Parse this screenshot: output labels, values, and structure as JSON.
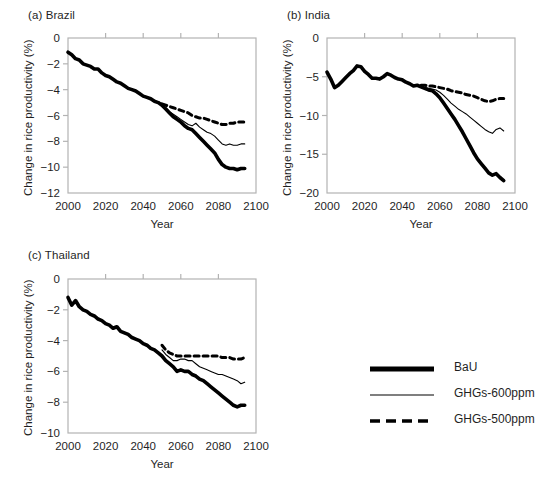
{
  "figure": {
    "axis_color": "#b3b3b3",
    "line_color": "#000000",
    "text_color": "#1f1f1f"
  },
  "panels": [
    {
      "key": "brazil",
      "title": "(a) Brazil",
      "ylabel": "Change in rice productivity (%)",
      "xlabel": "Year"
    },
    {
      "key": "india",
      "title": "(b) India",
      "ylabel": "Change in rice productivity (%)",
      "xlabel": "Year"
    },
    {
      "key": "thailand",
      "title": "(c) Thailand",
      "ylabel": "Change in rice productivity (%)",
      "xlabel": "Year"
    }
  ],
  "legend": {
    "items": [
      {
        "label": "BaU",
        "style": "thick-solid"
      },
      {
        "label": "GHGs-600ppm",
        "style": "thin-solid"
      },
      {
        "label": "GHGs-500ppm",
        "style": "dashed"
      }
    ]
  },
  "chart_data": [
    {
      "type": "line",
      "key": "brazil",
      "title": "(a) Brazil",
      "xlabel": "Year",
      "ylabel": "Change in rice productivity (%)",
      "xlim": [
        2000,
        2100
      ],
      "ylim": [
        -12,
        0
      ],
      "xticks": [
        2000,
        2020,
        2040,
        2060,
        2080,
        2100
      ],
      "yticks": [
        0,
        -2,
        -4,
        -6,
        -8,
        -10,
        -12
      ],
      "xticklabels": [
        "2000",
        "2020",
        "2040",
        "2060",
        "2080",
        "2100"
      ],
      "yticklabels": [
        "0",
        "−2",
        "−4",
        "−6",
        "−8",
        "−10",
        "−12"
      ],
      "grid": false,
      "legend_position": "external-right",
      "series": [
        {
          "name": "BaU",
          "style": "thick-solid",
          "x": [
            2000,
            2002,
            2004,
            2006,
            2008,
            2010,
            2012,
            2014,
            2016,
            2018,
            2020,
            2022,
            2024,
            2026,
            2028,
            2030,
            2032,
            2034,
            2036,
            2038,
            2040,
            2042,
            2044,
            2046,
            2048,
            2050,
            2052,
            2054,
            2056,
            2058,
            2060,
            2062,
            2064,
            2066,
            2068,
            2070,
            2072,
            2074,
            2076,
            2078,
            2080,
            2082,
            2084,
            2086,
            2088,
            2090,
            2092,
            2094
          ],
          "values": [
            -1.1,
            -1.3,
            -1.6,
            -1.7,
            -2.0,
            -2.1,
            -2.2,
            -2.4,
            -2.4,
            -2.7,
            -2.9,
            -3.0,
            -3.2,
            -3.4,
            -3.5,
            -3.7,
            -3.9,
            -4.0,
            -4.1,
            -4.3,
            -4.5,
            -4.6,
            -4.7,
            -4.9,
            -5.0,
            -5.2,
            -5.5,
            -5.8,
            -6.1,
            -6.3,
            -6.5,
            -6.8,
            -7.0,
            -7.1,
            -7.4,
            -7.7,
            -8.0,
            -8.3,
            -8.6,
            -8.9,
            -9.4,
            -9.8,
            -10.0,
            -10.1,
            -10.1,
            -10.2,
            -10.1,
            -10.1
          ]
        },
        {
          "name": "GHGs-600ppm",
          "style": "thin-solid",
          "x": [
            2050,
            2052,
            2054,
            2056,
            2058,
            2060,
            2062,
            2064,
            2066,
            2068,
            2070,
            2072,
            2074,
            2076,
            2078,
            2080,
            2082,
            2084,
            2086,
            2088,
            2090,
            2092,
            2094
          ],
          "values": [
            -5.2,
            -5.4,
            -5.7,
            -5.9,
            -6.1,
            -6.3,
            -6.5,
            -6.7,
            -6.8,
            -6.6,
            -6.9,
            -7.1,
            -7.3,
            -7.4,
            -7.6,
            -7.9,
            -8.2,
            -8.3,
            -8.2,
            -8.3,
            -8.3,
            -8.2,
            -8.2
          ]
        },
        {
          "name": "GHGs-500ppm",
          "style": "dashed",
          "x": [
            2050,
            2052,
            2054,
            2056,
            2058,
            2060,
            2062,
            2064,
            2066,
            2068,
            2070,
            2072,
            2074,
            2076,
            2078,
            2080,
            2082,
            2084,
            2086,
            2088,
            2090,
            2092,
            2094
          ],
          "values": [
            -5.1,
            -5.2,
            -5.3,
            -5.4,
            -5.5,
            -5.6,
            -5.7,
            -5.8,
            -6.0,
            -6.1,
            -6.2,
            -6.2,
            -6.3,
            -6.4,
            -6.5,
            -6.6,
            -6.7,
            -6.7,
            -6.6,
            -6.6,
            -6.5,
            -6.5,
            -6.5
          ]
        }
      ]
    },
    {
      "type": "line",
      "key": "india",
      "title": "(b) India",
      "xlabel": "Year",
      "ylabel": "Change in rice productivity (%)",
      "xlim": [
        2000,
        2100
      ],
      "ylim": [
        -20,
        0
      ],
      "xticks": [
        2000,
        2020,
        2040,
        2060,
        2080,
        2100
      ],
      "yticks": [
        0,
        -5,
        -10,
        -15,
        -20
      ],
      "xticklabels": [
        "2000",
        "2020",
        "2040",
        "2060",
        "2080",
        "2100"
      ],
      "yticklabels": [
        "0",
        "−5",
        "−10",
        "−15",
        "−20"
      ],
      "grid": false,
      "legend_position": "external-right",
      "series": [
        {
          "name": "BaU",
          "style": "thick-solid",
          "x": [
            2000,
            2002,
            2004,
            2006,
            2008,
            2010,
            2012,
            2014,
            2016,
            2018,
            2020,
            2022,
            2024,
            2026,
            2028,
            2030,
            2032,
            2034,
            2036,
            2038,
            2040,
            2042,
            2044,
            2046,
            2048,
            2050,
            2052,
            2054,
            2056,
            2058,
            2060,
            2062,
            2064,
            2066,
            2068,
            2070,
            2072,
            2074,
            2076,
            2078,
            2080,
            2082,
            2084,
            2086,
            2088,
            2090,
            2092,
            2094
          ],
          "values": [
            -4.4,
            -5.3,
            -6.4,
            -6.1,
            -5.6,
            -5.1,
            -4.6,
            -4.2,
            -3.6,
            -3.7,
            -4.3,
            -4.7,
            -5.2,
            -5.2,
            -5.3,
            -5.0,
            -4.6,
            -4.8,
            -5.1,
            -5.3,
            -5.4,
            -5.7,
            -5.9,
            -6.2,
            -6.1,
            -6.3,
            -6.5,
            -6.7,
            -6.8,
            -7.2,
            -7.7,
            -8.4,
            -9.1,
            -9.8,
            -10.5,
            -11.3,
            -12.1,
            -13.0,
            -13.9,
            -14.8,
            -15.6,
            -16.2,
            -16.8,
            -17.4,
            -17.7,
            -17.5,
            -18.0,
            -18.4
          ]
        },
        {
          "name": "GHGs-600ppm",
          "style": "thin-solid",
          "x": [
            2050,
            2052,
            2054,
            2056,
            2058,
            2060,
            2062,
            2064,
            2066,
            2068,
            2070,
            2072,
            2074,
            2076,
            2078,
            2080,
            2082,
            2084,
            2086,
            2088,
            2090,
            2092,
            2094
          ],
          "values": [
            -6.3,
            -6.4,
            -6.5,
            -6.6,
            -6.7,
            -7.0,
            -7.4,
            -7.9,
            -8.4,
            -8.8,
            -9.2,
            -9.5,
            -9.8,
            -10.2,
            -10.6,
            -11.0,
            -11.4,
            -11.8,
            -12.1,
            -12.3,
            -11.8,
            -11.6,
            -12.0
          ]
        },
        {
          "name": "GHGs-500ppm",
          "style": "dashed",
          "x": [
            2050,
            2052,
            2054,
            2056,
            2058,
            2060,
            2062,
            2064,
            2066,
            2068,
            2070,
            2072,
            2074,
            2076,
            2078,
            2080,
            2082,
            2084,
            2086,
            2088,
            2090,
            2092,
            2094
          ],
          "values": [
            -6.1,
            -6.1,
            -6.2,
            -6.2,
            -6.3,
            -6.4,
            -6.5,
            -6.6,
            -6.8,
            -6.9,
            -7.0,
            -7.1,
            -7.3,
            -7.4,
            -7.5,
            -7.7,
            -7.9,
            -8.1,
            -8.2,
            -8.1,
            -7.9,
            -7.8,
            -7.8
          ]
        }
      ]
    },
    {
      "type": "line",
      "key": "thailand",
      "title": "(c) Thailand",
      "xlabel": "Year",
      "ylabel": "Change in rice productivity (%)",
      "xlim": [
        2000,
        2100
      ],
      "ylim": [
        -10,
        0
      ],
      "xticks": [
        2000,
        2020,
        2040,
        2060,
        2080,
        2100
      ],
      "yticks": [
        0,
        -2,
        -4,
        -6,
        -8,
        -10
      ],
      "xticklabels": [
        "2000",
        "2020",
        "2040",
        "2060",
        "2080",
        "2100"
      ],
      "yticklabels": [
        "0",
        "−2",
        "−4",
        "−6",
        "−8",
        "−10"
      ],
      "grid": false,
      "legend_position": "external-right",
      "series": [
        {
          "name": "BaU",
          "style": "thick-solid",
          "x": [
            2000,
            2002,
            2004,
            2006,
            2008,
            2010,
            2012,
            2014,
            2016,
            2018,
            2020,
            2022,
            2024,
            2026,
            2028,
            2030,
            2032,
            2034,
            2036,
            2038,
            2040,
            2042,
            2044,
            2046,
            2048,
            2050,
            2052,
            2054,
            2056,
            2058,
            2060,
            2062,
            2064,
            2066,
            2068,
            2070,
            2072,
            2074,
            2076,
            2078,
            2080,
            2082,
            2084,
            2086,
            2088,
            2090,
            2092,
            2094
          ],
          "values": [
            -1.2,
            -1.7,
            -1.4,
            -1.8,
            -2.0,
            -2.1,
            -2.3,
            -2.4,
            -2.6,
            -2.7,
            -2.9,
            -3.0,
            -3.2,
            -3.1,
            -3.4,
            -3.5,
            -3.6,
            -3.8,
            -3.9,
            -4.0,
            -4.2,
            -4.3,
            -4.5,
            -4.6,
            -4.8,
            -5.0,
            -5.3,
            -5.5,
            -5.7,
            -6.0,
            -5.9,
            -6.0,
            -6.0,
            -6.2,
            -6.3,
            -6.5,
            -6.6,
            -6.8,
            -7.0,
            -7.2,
            -7.4,
            -7.6,
            -7.8,
            -8.0,
            -8.2,
            -8.3,
            -8.2,
            -8.2
          ]
        },
        {
          "name": "GHGs-600ppm",
          "style": "thin-solid",
          "x": [
            2050,
            2052,
            2054,
            2056,
            2058,
            2060,
            2062,
            2064,
            2066,
            2068,
            2070,
            2072,
            2074,
            2076,
            2078,
            2080,
            2082,
            2084,
            2086,
            2088,
            2090,
            2092,
            2094
          ],
          "values": [
            -4.6,
            -4.9,
            -5.1,
            -5.3,
            -5.3,
            -5.2,
            -5.2,
            -5.3,
            -5.3,
            -5.5,
            -5.7,
            -5.8,
            -5.9,
            -6.0,
            -6.1,
            -6.2,
            -6.2,
            -6.3,
            -6.4,
            -6.5,
            -6.6,
            -6.8,
            -6.7
          ]
        },
        {
          "name": "GHGs-500ppm",
          "style": "dashed",
          "x": [
            2050,
            2052,
            2054,
            2056,
            2058,
            2060,
            2062,
            2064,
            2066,
            2068,
            2070,
            2072,
            2074,
            2076,
            2078,
            2080,
            2082,
            2084,
            2086,
            2088,
            2090,
            2092,
            2094
          ],
          "values": [
            -4.3,
            -4.6,
            -4.8,
            -4.9,
            -5.0,
            -5.0,
            -5.0,
            -5.0,
            -5.0,
            -5.0,
            -5.0,
            -5.0,
            -5.0,
            -5.0,
            -5.0,
            -5.0,
            -5.1,
            -5.1,
            -5.1,
            -5.2,
            -5.2,
            -5.2,
            -5.1
          ]
        }
      ]
    }
  ]
}
